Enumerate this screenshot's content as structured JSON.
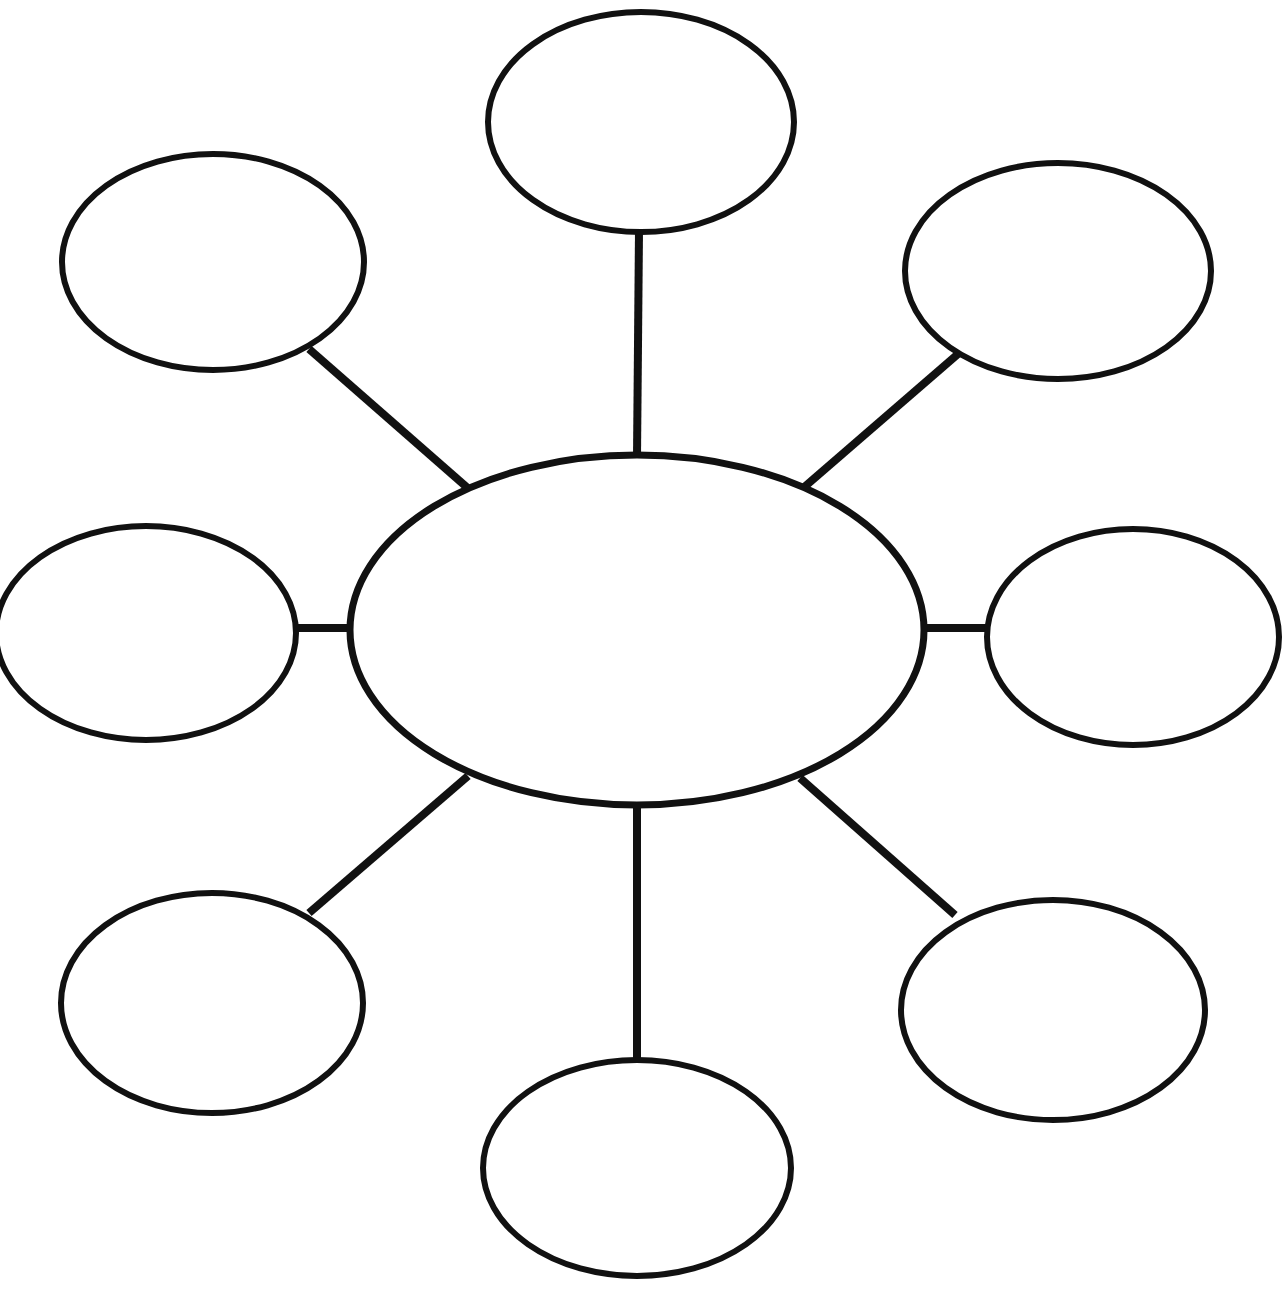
{
  "document": {
    "title": "Spider Web Graphic Organizer",
    "background_color": "#ffffff",
    "stroke_color": "#111111",
    "canvas": {
      "width": 1287,
      "height": 1290
    }
  },
  "diagram": {
    "type": "spider-web-graphic-organizer",
    "center": {
      "id": "center-node",
      "label": "",
      "cx": 637,
      "cy": 630,
      "rx": 287,
      "ry": 175,
      "stroke_width": 7
    },
    "satellites": [
      {
        "id": "node-top",
        "position": "top",
        "label": "",
        "cx": 641,
        "cy": 122,
        "rx": 153,
        "ry": 110,
        "stroke_width": 6
      },
      {
        "id": "node-top-right",
        "position": "top-right",
        "label": "",
        "cx": 1058,
        "cy": 271,
        "rx": 153,
        "ry": 108,
        "stroke_width": 6
      },
      {
        "id": "node-right",
        "position": "right",
        "label": "",
        "cx": 1133,
        "cy": 637,
        "rx": 146,
        "ry": 108,
        "stroke_width": 6
      },
      {
        "id": "node-bottom-right",
        "position": "bottom-right",
        "label": "",
        "cx": 1053,
        "cy": 1010,
        "rx": 152,
        "ry": 110,
        "stroke_width": 6
      },
      {
        "id": "node-bottom",
        "position": "bottom",
        "label": "",
        "cx": 637,
        "cy": 1168,
        "rx": 154,
        "ry": 108,
        "stroke_width": 6
      },
      {
        "id": "node-bottom-left",
        "position": "bottom-left",
        "label": "",
        "cx": 212,
        "cy": 1003,
        "rx": 151,
        "ry": 110,
        "stroke_width": 6
      },
      {
        "id": "node-left",
        "position": "left",
        "label": "",
        "cx": 146,
        "cy": 633,
        "rx": 150,
        "ry": 107,
        "stroke_width": 6
      },
      {
        "id": "node-top-left",
        "position": "top-left",
        "label": "",
        "cx": 213,
        "cy": 262,
        "rx": 151,
        "ry": 108,
        "stroke_width": 6
      }
    ],
    "connectors": [
      {
        "id": "connector-top",
        "from": "center-node",
        "to": "node-top",
        "x1": 637,
        "y1": 457,
        "x2": 639,
        "y2": 231,
        "stroke_width": 8
      },
      {
        "id": "connector-top-right",
        "from": "center-node",
        "to": "node-top-right",
        "x1": 802,
        "y1": 489,
        "x2": 958,
        "y2": 354,
        "stroke_width": 8
      },
      {
        "id": "connector-right",
        "from": "center-node",
        "to": "node-right",
        "x1": 920,
        "y1": 628,
        "x2": 990,
        "y2": 628,
        "stroke_width": 8
      },
      {
        "id": "connector-bottom-right",
        "from": "center-node",
        "to": "node-bottom-right",
        "x1": 800,
        "y1": 778,
        "x2": 955,
        "y2": 915,
        "stroke_width": 8
      },
      {
        "id": "connector-bottom",
        "from": "center-node",
        "to": "node-bottom",
        "x1": 637,
        "y1": 803,
        "x2": 637,
        "y2": 1064,
        "stroke_width": 8
      },
      {
        "id": "connector-bottom-left",
        "from": "center-node",
        "to": "node-bottom-left",
        "x1": 468,
        "y1": 776,
        "x2": 309,
        "y2": 913,
        "stroke_width": 8
      },
      {
        "id": "connector-left",
        "from": "center-node",
        "to": "node-left",
        "x1": 352,
        "y1": 628,
        "x2": 292,
        "y2": 628,
        "stroke_width": 8
      },
      {
        "id": "connector-top-left",
        "from": "center-node",
        "to": "node-top-left",
        "x1": 470,
        "y1": 490,
        "x2": 309,
        "y2": 349,
        "stroke_width": 8
      }
    ]
  }
}
